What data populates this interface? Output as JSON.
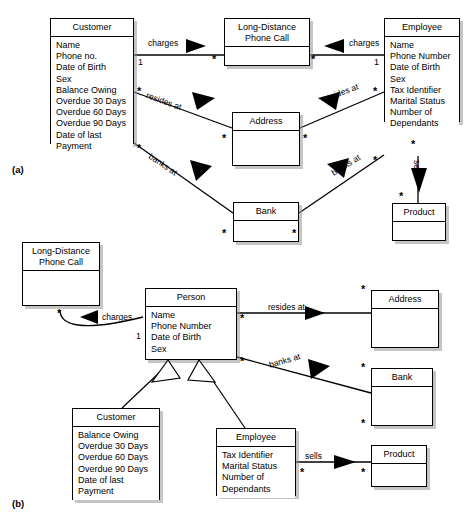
{
  "figure": {
    "part_a_label": "(a)",
    "part_b_label": "(b)"
  },
  "diagram_a": {
    "classes": {
      "customer": {
        "name": "Customer",
        "attributes": [
          "Name",
          "Phone no.",
          "Date of Birth",
          "Sex",
          "Balance Owing",
          "Overdue 30 Days",
          "Overdue 60 Days",
          "Overdue 90 Days",
          "Date of last",
          "Payment"
        ]
      },
      "phone_call": {
        "name_line1": "Long-Distance",
        "name_line2": "Phone Call",
        "attributes": []
      },
      "employee": {
        "name": "Employee",
        "attributes": [
          "Name",
          "Phone Number",
          "Date of Birth",
          "Sex",
          "Tax Identifier",
          "Marital Status",
          "Number of",
          "Dependants"
        ]
      },
      "address": {
        "name": "Address",
        "attributes": []
      },
      "bank": {
        "name": "Bank",
        "attributes": []
      },
      "product": {
        "name": "Product",
        "attributes": []
      }
    },
    "associations": {
      "customer_charges": "charges",
      "employee_charges": "charges",
      "customer_resides": "resides at",
      "employee_resides": "resides at",
      "customer_banks": "banks at",
      "employee_banks": "banks at",
      "employee_sells": "sells"
    },
    "multiplicities": {
      "customer_charges_near": "1",
      "customer_charges_far": "*",
      "employee_charges_near": "1",
      "employee_charges_far": "*",
      "customer_resides_near": "*",
      "address_from_customer": "*",
      "employee_resides_near": "*",
      "address_from_employee": "*",
      "customer_banks_near": "*",
      "bank_from_customer": "*",
      "employee_banks_near": "*",
      "bank_from_employee": "*",
      "employee_sells_near": "*",
      "product_from_employee": "*"
    }
  },
  "diagram_b": {
    "classes": {
      "phone_call": {
        "name_line1": "Long-Distance",
        "name_line2": "Phone Call",
        "attributes": []
      },
      "person": {
        "name": "Person",
        "attributes": [
          "Name",
          "Phone Number",
          "Date of Birth",
          "Sex"
        ]
      },
      "customer": {
        "name": "Customer",
        "attributes": [
          "Balance Owing",
          "Overdue 30 Days",
          "Overdue 60 Days",
          "Overdue 90 Days",
          "Date of last",
          "Payment"
        ]
      },
      "employee": {
        "name": "Employee",
        "attributes": [
          "Tax Identifier",
          "Marital Status",
          "Number of",
          "Dependants"
        ]
      },
      "address": {
        "name": "Address",
        "attributes": []
      },
      "bank": {
        "name": "Bank",
        "attributes": []
      },
      "product": {
        "name": "Product",
        "attributes": []
      }
    },
    "associations": {
      "charges": "charges",
      "resides_at": "resides at",
      "banks_at": "banks at",
      "sells": "sells"
    },
    "multiplicities": {
      "phonecall_charges": "*",
      "person_charges": "1",
      "person_resides": "*",
      "address_resides": "*",
      "person_banks": "*",
      "bank_banks": "*",
      "employee_sells": "*",
      "product_sells": "*"
    }
  },
  "colors": {
    "line": "#000000",
    "box_fill": "#ffffff",
    "shadow": "#969696"
  }
}
